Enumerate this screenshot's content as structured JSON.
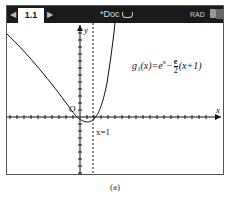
{
  "topbar": {
    "prev_arrow": "◀",
    "tab_label": "1.1",
    "next_arrow": "▶",
    "doc_title": "*Doc",
    "mode": "RAD"
  },
  "graph": {
    "function_name": "g₁(x)",
    "function_eq": "=e",
    "exponent": "x",
    "minus": "−",
    "frac_num": "e",
    "frac_den": "2",
    "tail": "(x+1)",
    "origin_label": "O",
    "x_axis_label": "x",
    "y_axis_label": "y",
    "asymptote_label": "x=1"
  },
  "caption": "(a)"
}
